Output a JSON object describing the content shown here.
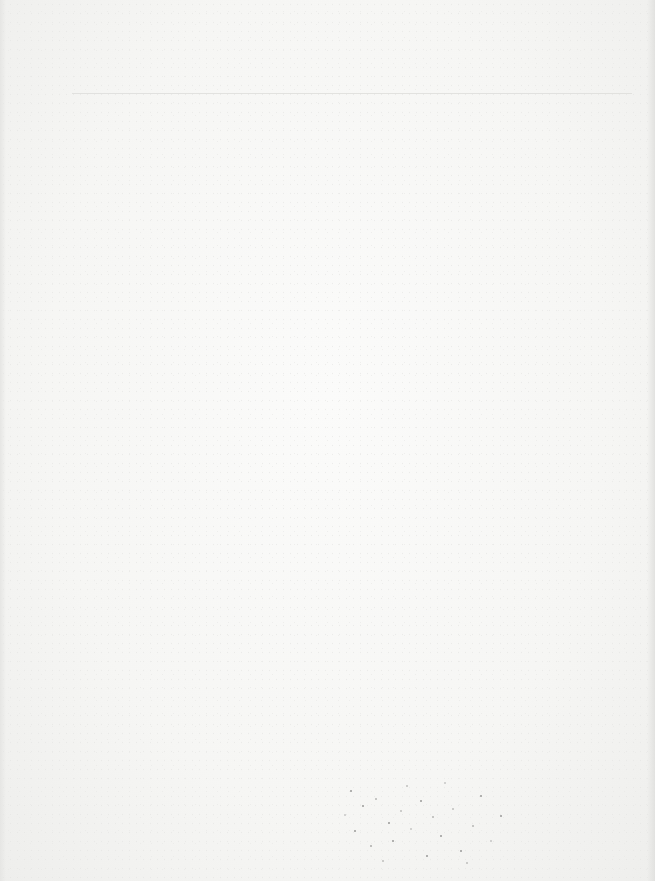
{
  "document": {
    "type": "scanned-blank-page",
    "text_content": [],
    "colors": {
      "paper": "#f6f6f4",
      "rule": "#dcdcda",
      "speckle": "#9a9a98"
    }
  }
}
